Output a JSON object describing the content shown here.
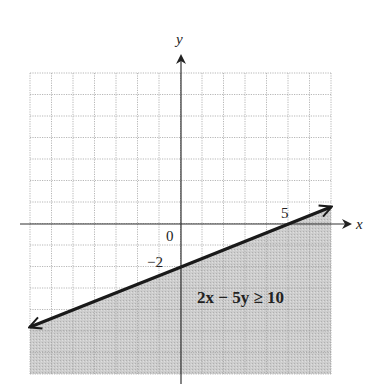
{
  "chart_data": {
    "type": "line",
    "title": "",
    "xlabel": "x",
    "ylabel": "y",
    "xlim": [
      -7,
      7
    ],
    "ylim": [
      -7,
      7
    ],
    "grid": true,
    "grid_step": 1,
    "boundary_line": {
      "equation": "2x - 5y = 10",
      "slope": 0.4,
      "intercept": -2,
      "style": "solid",
      "points": [
        [
          -7,
          -4.8
        ],
        [
          0,
          -2
        ],
        [
          5,
          0
        ],
        [
          7,
          0.8
        ]
      ]
    },
    "shaded_region": "below line",
    "annotations": [
      {
        "text": "2x − 5y ≥ 10",
        "x": 2.2,
        "y": -3.6
      },
      {
        "text": "0",
        "x": -0.4,
        "y": -0.5
      },
      {
        "text": "−2",
        "x": -0.7,
        "y": -1.7
      },
      {
        "text": "5",
        "x": 4.95,
        "y": 0.5
      }
    ]
  },
  "labels": {
    "x_axis": "x",
    "y_axis": "y",
    "origin": "0",
    "y_tick": "−2",
    "x_tick": "5",
    "inequality": "2x − 5y ≥ 10"
  },
  "colors": {
    "shade": "#c9c9c9",
    "grid": "#9a9a9a",
    "axis": "#333333",
    "line": "#1a1a1a"
  }
}
